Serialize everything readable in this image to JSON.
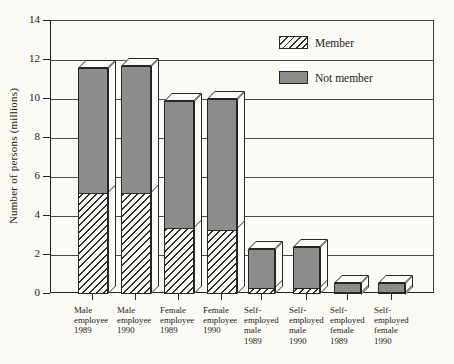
{
  "chart_data": {
    "type": "bar",
    "stacked": true,
    "title": "",
    "xlabel": "",
    "ylabel": "Number of persons (millions)",
    "ylim": [
      0,
      14
    ],
    "yticks": [
      0,
      2,
      4,
      6,
      8,
      10,
      12,
      14
    ],
    "grid": true,
    "legend_position": "top-right-inside-plot",
    "style": "pseudo-3d outlined bars, hatched member segment below solid gray non-member segment",
    "categories": [
      "Male employee 1989",
      "Male employee 1990",
      "Female employee 1989",
      "Female employee 1990",
      "Self-employed male 1989",
      "Self-employed male 1990",
      "Self-employed female 1989",
      "Self-employed female 1990"
    ],
    "category_label_lines": [
      [
        "Male",
        "employee",
        "1989"
      ],
      [
        "Male",
        "employee",
        "1990"
      ],
      [
        "Female",
        "employee",
        "1989"
      ],
      [
        "Female",
        "employee",
        "1990"
      ],
      [
        "Self-",
        "employed",
        "male",
        "1989"
      ],
      [
        "Self-",
        "employed",
        "male",
        "1990"
      ],
      [
        "Self-",
        "employed",
        "female",
        "1989"
      ],
      [
        "Self-",
        "employed",
        "female",
        "1990"
      ]
    ],
    "series": [
      {
        "name": "Member",
        "pattern": "diagonal-hatch",
        "values": [
          5.2,
          5.2,
          3.4,
          3.3,
          0.3,
          0.3,
          0.1,
          0.1
        ]
      },
      {
        "name": "Not member",
        "fill": "#8c8c8c",
        "values": [
          6.8,
          6.9,
          6.9,
          7.1,
          2.4,
          2.5,
          0.9,
          0.9
        ]
      }
    ],
    "stack_totals": [
      12.0,
      12.1,
      10.3,
      10.4,
      2.7,
      2.8,
      1.0,
      1.0
    ],
    "colors": {
      "outline": "#262626",
      "hatch_line": "#2e2e2e",
      "not_member_fill": "#8c8c8c",
      "background": "#fbfaf5",
      "gridline": "#4c4c4c"
    }
  }
}
